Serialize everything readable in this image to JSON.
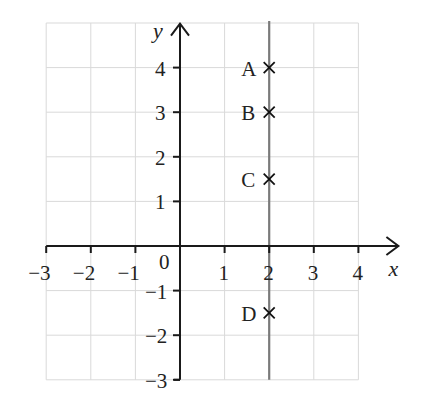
{
  "chart_data": {
    "type": "scatter",
    "title": "",
    "xlabel": "x",
    "ylabel": "y",
    "xlim": [
      -3,
      4
    ],
    "ylim": [
      -3,
      4
    ],
    "grid_range": {
      "x": [
        -3,
        4
      ],
      "y": [
        -3,
        5
      ]
    },
    "grid": true,
    "x_ticks": [
      -3,
      -2,
      -1,
      0,
      1,
      2,
      3,
      4
    ],
    "x_tick_labels": [
      "−3",
      "−2",
      "−1",
      "0",
      "1",
      "2",
      "3",
      "4"
    ],
    "y_ticks": [
      -3,
      -2,
      -1,
      1,
      2,
      3,
      4
    ],
    "y_tick_labels": [
      "−3",
      "−2",
      "−1",
      "1",
      "2",
      "3",
      "4"
    ],
    "origin_label": "0",
    "lines": [
      {
        "name": "x = 2",
        "type": "vertical",
        "x": 2,
        "color": "#7a7a7a"
      }
    ],
    "points": [
      {
        "label": "A",
        "x": 2,
        "y": 4,
        "marker": "×"
      },
      {
        "label": "B",
        "x": 2,
        "y": 3,
        "marker": "×"
      },
      {
        "label": "C",
        "x": 2,
        "y": 1.5,
        "marker": "×"
      },
      {
        "label": "D",
        "x": 2,
        "y": -1.5,
        "marker": "×"
      }
    ],
    "legend": null
  },
  "colors": {
    "axis": "#1a1a1a",
    "grid": "#d9d9d9",
    "vertical_line": "#7a7a7a",
    "text": "#222222"
  }
}
